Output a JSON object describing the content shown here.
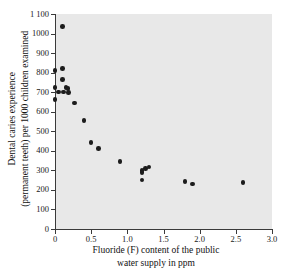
{
  "chart_data": {
    "type": "scatter",
    "title": "",
    "xlabel": "Fluoride (F) content of the public water supply in ppm",
    "xlabel_line1": "Fluoride (F) content of the public",
    "xlabel_line2": "water supply in ppm",
    "ylabel": "Dental caries experience (permanent teeth) per 1000 children examined",
    "ylabel_line1": "Dental caries experience",
    "ylabel_line2": "(permanent teeth) per 1000 children examined",
    "xlim": [
      0,
      3.0
    ],
    "ylim": [
      0,
      1100
    ],
    "xticks": [
      0,
      0.5,
      1.0,
      1.5,
      2.0,
      2.5,
      3.0
    ],
    "xtick_labels": [
      "0",
      "0.5",
      "1.0",
      "1.5",
      "2.0",
      "2.5",
      "3.0"
    ],
    "yticks": [
      0,
      100,
      200,
      300,
      400,
      500,
      600,
      700,
      800,
      900,
      1000,
      1100
    ],
    "ytick_labels": [
      "0",
      "100",
      "200",
      "300",
      "400",
      "500",
      "600",
      "700",
      "800",
      "900",
      "1000",
      "1 100"
    ],
    "grid": false,
    "legend": false,
    "marker_color": "#1c1c1c",
    "plot_background": "#e8e8e8",
    "figure_background": "#ffffff",
    "points": [
      {
        "x": 0.1,
        "y": 1035
      },
      {
        "x": 0.0,
        "y": 810
      },
      {
        "x": 0.1,
        "y": 820
      },
      {
        "x": 0.1,
        "y": 765
      },
      {
        "x": 0.0,
        "y": 725
      },
      {
        "x": 0.05,
        "y": 700
      },
      {
        "x": 0.15,
        "y": 725
      },
      {
        "x": 0.18,
        "y": 720
      },
      {
        "x": 0.12,
        "y": 700
      },
      {
        "x": 0.19,
        "y": 698
      },
      {
        "x": 0.0,
        "y": 663
      },
      {
        "x": 0.27,
        "y": 645
      },
      {
        "x": 0.4,
        "y": 555
      },
      {
        "x": 0.5,
        "y": 443
      },
      {
        "x": 0.6,
        "y": 413
      },
      {
        "x": 0.9,
        "y": 344
      },
      {
        "x": 1.2,
        "y": 300
      },
      {
        "x": 1.2,
        "y": 290
      },
      {
        "x": 1.25,
        "y": 310
      },
      {
        "x": 1.2,
        "y": 251
      },
      {
        "x": 1.3,
        "y": 318
      },
      {
        "x": 1.8,
        "y": 243
      },
      {
        "x": 1.9,
        "y": 231
      },
      {
        "x": 2.6,
        "y": 237
      }
    ]
  }
}
